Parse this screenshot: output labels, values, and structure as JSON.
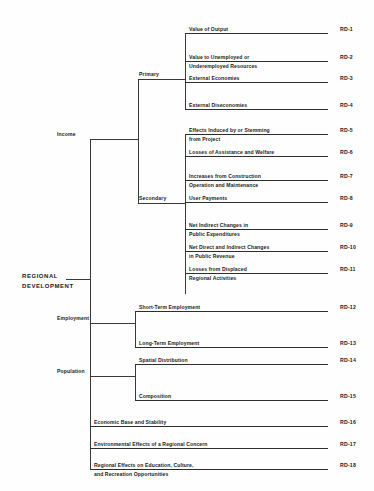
{
  "diagram": {
    "title": "REGIONAL DEVELOPMENT",
    "root": {
      "line1": "REGIONAL",
      "line2": "DEVELOPMENT"
    },
    "branches": {
      "income": "Income",
      "primary": "Primary",
      "secondary": "Secondary",
      "employment": "Employment",
      "population": "Population"
    },
    "leaves": [
      {
        "code": "RD-1",
        "line1": "Value of Output",
        "line2": ""
      },
      {
        "code": "RD-2",
        "line1": "Value to Unemployed or",
        "line2": "Underemployed Resources"
      },
      {
        "code": "RD-3",
        "line1": "External Economies",
        "line2": ""
      },
      {
        "code": "RD-4",
        "line1": "External Diseconomies",
        "line2": ""
      },
      {
        "code": "RD-5",
        "line1": "Effects Induced by or Stemming",
        "line2": "from Project"
      },
      {
        "code": "RD-6",
        "line1": "Losses of Assistance and Welfare",
        "line2": ""
      },
      {
        "code": "RD-7",
        "line1": "Increases from Construction",
        "line2": "Operation and Maintenance"
      },
      {
        "code": "RD-8",
        "line1": "User Payments",
        "line2": ""
      },
      {
        "code": "RD-9",
        "line1": "Net Indirect Changes in",
        "line2": "Public Expenditures"
      },
      {
        "code": "RD-10",
        "line1": "Net Direct and Indirect Changes",
        "line2": "in Public Revenue"
      },
      {
        "code": "RD-11",
        "line1": "Losses from Displaced",
        "line2": "Regional Activities"
      },
      {
        "code": "RD-12",
        "line1": "Short-Term Employment",
        "line2": ""
      },
      {
        "code": "RD-13",
        "line1": "Long-Term Employment",
        "line2": ""
      },
      {
        "code": "RD-14",
        "line1": "Spatial Distribution",
        "line2": ""
      },
      {
        "code": "RD-15",
        "line1": "Composition",
        "line2": ""
      },
      {
        "code": "RD-16",
        "line1": "Economic Base and Stability",
        "line2": ""
      },
      {
        "code": "RD-17",
        "line1": "Environmental Effects of a Regional Concern",
        "line2": ""
      },
      {
        "code": "RD-18",
        "line1": "Regional Effects on Education, Culture,",
        "line2": "and Recreation Opportunities"
      }
    ]
  }
}
